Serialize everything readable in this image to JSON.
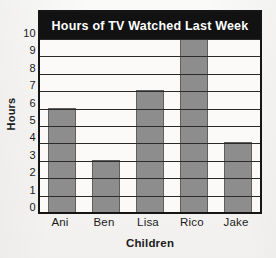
{
  "chart_data": {
    "type": "bar",
    "title": "Hours of TV Watched Last Week",
    "categories": [
      "Ani",
      "Ben",
      "Lisa",
      "Rico",
      "Jake"
    ],
    "values": [
      6,
      3,
      7,
      10,
      4
    ],
    "xlabel": "Children",
    "ylabel": "Hours",
    "ylim": [
      0,
      10
    ],
    "ytick_labels": [
      "10",
      "9",
      "8",
      "7",
      "6",
      "5",
      "4",
      "3",
      "2",
      "1",
      "0"
    ],
    "ytick_values": [
      10,
      9,
      8,
      7,
      6,
      5,
      4,
      3,
      2,
      1,
      0
    ],
    "grid": true,
    "grid_orientation": "horizontal",
    "legend": false,
    "legend_position": "none",
    "bar_color": "#8d8d8d",
    "bar_edge_color": "#5f5f5f",
    "title_background_color": "#121212",
    "title_text_color": "#ffffff",
    "plot_background_color": "#fbfaf8",
    "axis_color": "#151515",
    "page_background_color": "#f6f5f3"
  }
}
